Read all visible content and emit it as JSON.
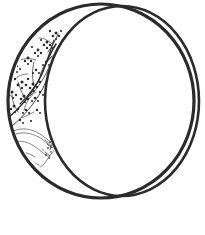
{
  "artwork": {
    "title": "Crescent Moon with Blossoming Branch",
    "medium": "Black ink line drawing on white ground",
    "subject": "crescent-moon-with-plum-blossom-branch-and-cloud",
    "canvas": {
      "width": 205,
      "height": 235,
      "background_color": "#ffffff"
    },
    "ink_color": "#2b2b2b",
    "ink_color_light": "#4a4a4a",
    "ink_color_faint": "#6f6f6f",
    "description": "A thin-line crescent moon drawn as two overlapping circle arcs. The narrow crescent sliver on the left is filled with a flowering plum branch at the top and a stylized cloud or mist band at the bottom. The large inner disc is left blank white."
  },
  "shapes": {
    "outer_circle": {
      "name": "outer-circle-arc",
      "center_x": 101,
      "center_y": 101,
      "radius_x": 93,
      "radius_y": 97,
      "stroke_width": 3.2,
      "color": "#2b2b2b"
    },
    "inner_circle": {
      "name": "inner-circle-arc",
      "center_x": 122,
      "center_y": 101,
      "radius_x": 77,
      "radius_y": 95,
      "stroke_width": 2.6,
      "color": "#2b2b2b"
    },
    "crescent": {
      "name": "crescent-sliver",
      "top_cusp_x": 114,
      "top_cusp_y": 6,
      "bottom_cusp_x": 113,
      "bottom_cusp_y": 196,
      "widest_x": 10,
      "widest_y": 104,
      "fill": "#ffffff"
    },
    "cloud": {
      "name": "cloud-motif",
      "top_y": 128,
      "bottom_y": 173,
      "left_x": 14,
      "right_x": 62,
      "stroke_width": 0.8,
      "color": "#6f6f6f"
    },
    "branch": {
      "name": "blossom-branch",
      "top_y": 30,
      "bottom_y": 128,
      "left_x": 10,
      "right_x": 60,
      "blossom_count": 34,
      "stroke_width": 1.0,
      "color": "#2b2b2b"
    }
  },
  "labels": {
    "alt_text": "Line drawing of a crescent moon decorated with a flowering branch and cloud"
  }
}
